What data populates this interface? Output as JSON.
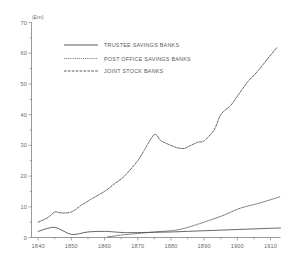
{
  "chart_data": {
    "type": "line",
    "title": "",
    "subtitle": "",
    "xlabel": "",
    "ylabel": "(£m)",
    "unit_label": "(£m)",
    "xlim": [
      1838,
      1913
    ],
    "ylim": [
      0,
      70
    ],
    "grid": false,
    "legend_position": "top-center",
    "x_ticks_major": [
      1840,
      1850,
      1860,
      1870,
      1880,
      1890,
      1900,
      1910
    ],
    "x_tick_labels": [
      "1840",
      "1850",
      "1860",
      "1870",
      "1880",
      "1890",
      "1900",
      "1910"
    ],
    "x_ticks_minor": [
      1845,
      1855,
      1865,
      1875,
      1885,
      1895,
      1905
    ],
    "y_ticks_major": [
      0,
      10,
      20,
      30,
      40,
      50,
      60,
      70
    ],
    "y_tick_labels": [
      "0",
      "10",
      "20",
      "30",
      "40",
      "50",
      "60",
      "70"
    ],
    "y_ticks_minor": [
      5,
      15,
      25,
      35,
      45,
      55,
      65
    ],
    "series": [
      {
        "name": "TRUSTEE SAVINGS BANKS",
        "style": "solid",
        "color": "#4a4a4a",
        "x": [
          1840,
          1845,
          1850,
          1855,
          1860,
          1863,
          1866,
          1870,
          1875,
          1880,
          1885,
          1890,
          1895,
          1900,
          1905,
          1910,
          1913
        ],
        "values": [
          2.0,
          3.3,
          1.0,
          1.8,
          2.0,
          1.8,
          1.6,
          1.6,
          1.7,
          1.8,
          2.0,
          2.2,
          2.4,
          2.6,
          2.8,
          3.0,
          3.1
        ]
      },
      {
        "name": "POST OFFICE SAVINGS BANKS",
        "style": "dotted",
        "color": "#4a4a4a",
        "x": [
          1861,
          1863,
          1865,
          1868,
          1870,
          1873,
          1876,
          1880,
          1883,
          1886,
          1890,
          1893,
          1896,
          1900,
          1903,
          1906,
          1910,
          1913
        ],
        "values": [
          0.2,
          0.5,
          0.8,
          1.1,
          1.3,
          1.6,
          1.9,
          2.2,
          2.7,
          3.6,
          5.0,
          6.1,
          7.3,
          9.2,
          10.2,
          11.0,
          12.3,
          13.3
        ]
      },
      {
        "name": "JOINT STOCK BANKS",
        "style": "dashed",
        "color": "#4a4a4a",
        "x": [
          1840,
          1843,
          1845,
          1847,
          1850,
          1853,
          1856,
          1860,
          1863,
          1866,
          1870,
          1872,
          1875,
          1877,
          1880,
          1882,
          1884,
          1886,
          1888,
          1890,
          1893,
          1895,
          1898,
          1900,
          1903,
          1906,
          1909,
          1912
        ],
        "values": [
          5.0,
          6.5,
          8.3,
          8.0,
          8.3,
          10.5,
          12.5,
          15.0,
          17.5,
          20.0,
          25.0,
          28.5,
          33.5,
          31.5,
          30.0,
          29.2,
          29.0,
          30.0,
          31.0,
          31.5,
          35.0,
          40.0,
          43.0,
          46.0,
          50.5,
          54.0,
          58.0,
          62.0
        ]
      }
    ]
  },
  "legend": {
    "entries": [
      {
        "label": "TRUSTEE SAVINGS BANKS",
        "style": "solid"
      },
      {
        "label": "POST OFFICE SAVINGS BANKS",
        "style": "dotted"
      },
      {
        "label": "JOINT STOCK BANKS",
        "style": "dashed"
      }
    ]
  }
}
